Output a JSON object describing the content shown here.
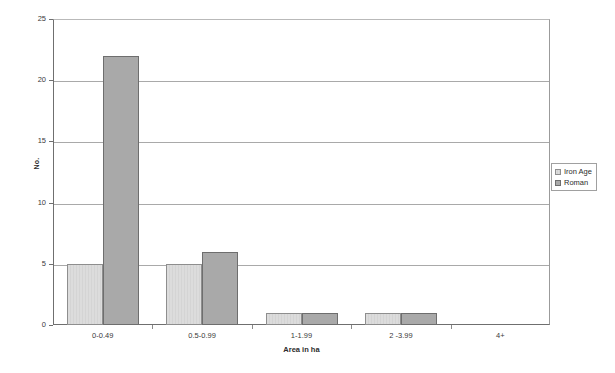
{
  "chart_data": {
    "type": "bar",
    "title": "",
    "subtitle": "",
    "xlabel": "Area in ha",
    "ylabel": "No.",
    "categories": [
      "0-0.49",
      "0.5-0.99",
      "1-1.99",
      "2 -3.99",
      "4+"
    ],
    "series": [
      {
        "name": "Iron Age",
        "color": "#dcdcdc",
        "values": [
          5,
          5,
          1,
          1,
          0
        ]
      },
      {
        "name": "Roman",
        "color": "#a9a9a9",
        "values": [
          22,
          6,
          1,
          1,
          0
        ]
      }
    ],
    "ylim": [
      0,
      25
    ],
    "yticks": [
      0,
      5,
      10,
      15,
      20,
      25
    ],
    "ytick_labels": [
      "0",
      "5",
      "10",
      "15",
      "20",
      "25"
    ],
    "grid": "horizontal",
    "legend_position": "right",
    "legend_entries": [
      "Iron Age",
      "Roman"
    ]
  },
  "axes": {
    "y_title": "No.",
    "x_title": "Area in ha"
  },
  "legend": {
    "items": [
      {
        "label": "Iron Age"
      },
      {
        "label": "Roman"
      }
    ]
  }
}
